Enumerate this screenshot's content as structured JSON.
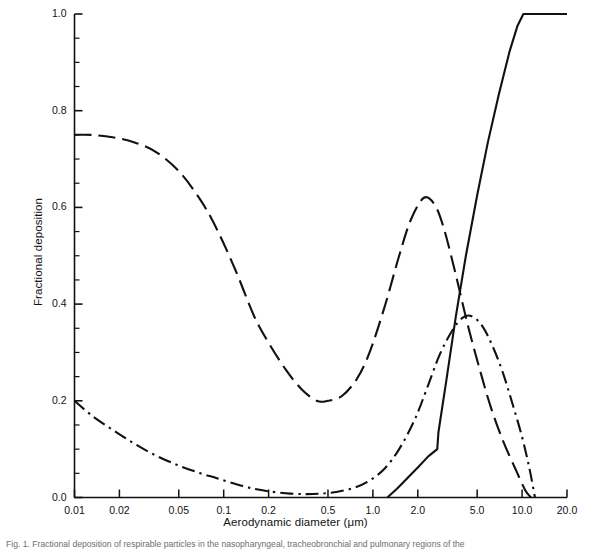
{
  "figure": {
    "background_color": "#ffffff",
    "line_color": "#111111",
    "caption": "Fig. 1.  Fractional deposition of respirable particles in the nasopharyngeal, tracheobronchial and pulmonary regions of the"
  },
  "axes": {
    "x": {
      "title": "Aerodynamic diameter (μm)",
      "scale": "log",
      "min": 0.01,
      "max": 20.0,
      "tick_values": [
        0.01,
        0.02,
        0.05,
        0.1,
        0.2,
        0.5,
        1.0,
        2.0,
        5.0,
        10.0,
        20.0
      ],
      "tick_labels": [
        "0.01",
        "0.02",
        "0.05",
        "0.1",
        "0.2",
        "0.5",
        "1.0",
        "2.0",
        "5.0",
        "10.0",
        "20.0"
      ]
    },
    "y": {
      "title": "Fractional deposition",
      "scale": "linear",
      "min": 0.0,
      "max": 1.0,
      "tick_values": [
        0.0,
        0.2,
        0.4,
        0.6,
        0.8,
        1.0
      ],
      "tick_labels": [
        "0.0",
        "0.2",
        "0.4",
        "0.6",
        "0.8",
        "1.0"
      ],
      "minor_tick_step": 0.05
    }
  },
  "chart_data": {
    "type": "line",
    "title": "",
    "subtitle": "",
    "xlabel": "Aerodynamic diameter (μm)",
    "ylabel": "Fractional deposition",
    "xscale": "log",
    "xlim": [
      0.01,
      20.0
    ],
    "ylim": [
      0.0,
      1.0
    ],
    "grid": false,
    "legend": "none",
    "x_ticks": [
      0.01,
      0.02,
      0.05,
      0.1,
      0.2,
      0.5,
      1.0,
      2.0,
      5.0,
      10.0,
      20.0
    ],
    "y_ticks": [
      0.0,
      0.2,
      0.4,
      0.6,
      0.8,
      1.0
    ],
    "series": [
      {
        "name": "pulmonary",
        "style": "dashed",
        "x": [
          0.01,
          0.013,
          0.018,
          0.025,
          0.035,
          0.05,
          0.07,
          0.09,
          0.12,
          0.16,
          0.2,
          0.26,
          0.33,
          0.42,
          0.5,
          0.62,
          0.78,
          0.95,
          1.2,
          1.5,
          1.8,
          2.2,
          2.6,
          3.0,
          3.6,
          4.3,
          5.2,
          6.2,
          7.5,
          9.0,
          10.5,
          11.5
        ],
        "y": [
          0.75,
          0.75,
          0.745,
          0.735,
          0.715,
          0.675,
          0.615,
          0.555,
          0.47,
          0.375,
          0.32,
          0.265,
          0.225,
          0.2,
          0.2,
          0.21,
          0.245,
          0.3,
          0.395,
          0.5,
          0.575,
          0.62,
          0.605,
          0.555,
          0.46,
          0.36,
          0.265,
          0.185,
          0.115,
          0.06,
          0.015,
          0.0
        ]
      },
      {
        "name": "tracheobronchial",
        "style": "dash-dot",
        "x": [
          0.01,
          0.013,
          0.018,
          0.025,
          0.035,
          0.05,
          0.07,
          0.09,
          0.12,
          0.16,
          0.21,
          0.28,
          0.36,
          0.45,
          0.58,
          0.75,
          0.95,
          1.2,
          1.5,
          1.9,
          2.3,
          2.8,
          3.4,
          4.0,
          4.6,
          5.4,
          6.3,
          7.4,
          8.6,
          10.0,
          11.2,
          12.2
        ],
        "y": [
          0.2,
          0.17,
          0.14,
          0.112,
          0.087,
          0.066,
          0.05,
          0.04,
          0.028,
          0.018,
          0.012,
          0.008,
          0.007,
          0.008,
          0.012,
          0.02,
          0.035,
          0.06,
          0.1,
          0.16,
          0.225,
          0.295,
          0.345,
          0.372,
          0.375,
          0.355,
          0.315,
          0.26,
          0.195,
          0.125,
          0.06,
          0.0
        ]
      },
      {
        "name": "nasopharyngeal",
        "style": "solid",
        "x": [
          1.25,
          1.45,
          1.7,
          2.0,
          2.35,
          2.7,
          2.75,
          3.1,
          3.6,
          4.2,
          5.0,
          5.9,
          7.0,
          8.2,
          9.3,
          10.2,
          11.0,
          12.5,
          14.5,
          17.0,
          20.0
        ],
        "y": [
          0.0,
          0.018,
          0.04,
          0.062,
          0.085,
          0.1,
          0.135,
          0.24,
          0.375,
          0.5,
          0.625,
          0.735,
          0.835,
          0.92,
          0.975,
          1.0,
          1.0,
          1.0,
          1.0,
          1.0,
          1.0
        ]
      }
    ]
  }
}
